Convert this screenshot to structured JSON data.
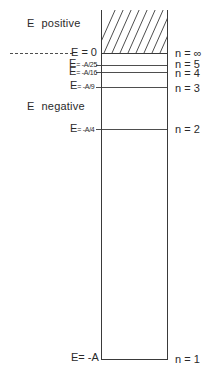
{
  "diagram": {
    "type": "energy-level-diagram",
    "regions": {
      "positive": {
        "label_E": "E",
        "label_word": "positive"
      },
      "negative": {
        "label_E": "E",
        "label_word": "negative"
      }
    },
    "levels": [
      {
        "id": "inf",
        "energy_label_main": "E = 0",
        "energy_label_sub": "",
        "n_label": "n = ∞",
        "y": 53
      },
      {
        "id": "n5",
        "energy_label_main": "E",
        "energy_label_sub": "= -A/25",
        "n_label": "n = 5",
        "y": 65
      },
      {
        "id": "n4",
        "energy_label_main": "E",
        "energy_label_sub": "= -A/16",
        "n_label": "n = 4",
        "y": 72
      },
      {
        "id": "n3",
        "energy_label_main": "E",
        "energy_label_sub": "= -A/9",
        "n_label": "n = 3",
        "y": 87
      },
      {
        "id": "n2",
        "energy_label_main": "E",
        "energy_label_sub": "= -A/4",
        "n_label": "n = 2",
        "y": 129
      },
      {
        "id": "n1",
        "energy_label_main": "E= -A",
        "energy_label_sub": "",
        "n_label": "n = 1",
        "y": 359
      }
    ],
    "continuum": {
      "hatched": true,
      "description": "continuum above E = 0"
    },
    "colors": {
      "line": "#3a3a3a",
      "text": "#2a2a2a",
      "background": "#ffffff"
    }
  }
}
